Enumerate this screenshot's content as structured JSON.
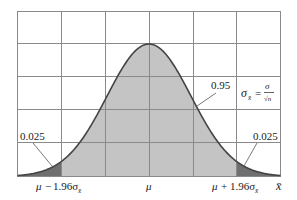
{
  "chart_data": {
    "type": "area",
    "title": "",
    "xlabel": "x̄",
    "ylabel": "",
    "mean_label": "μ",
    "tick_labels": [
      "μ − 1.96σx̄",
      "μ",
      "μ + 1.96σx̄"
    ],
    "regions": [
      {
        "name": "lower tail",
        "area": 0.025,
        "label": "0.025"
      },
      {
        "name": "central",
        "area": 0.95,
        "label": "0.95"
      },
      {
        "name": "upper tail",
        "area": 0.025,
        "label": "0.025"
      }
    ],
    "annotation_formula": "σx̄ = σ/√n",
    "grid": true,
    "grid_columns": 6,
    "grid_rows": 5,
    "colors": {
      "tail_fill": "#6f6f6f",
      "central_fill": "#c4c4c4",
      "curve": "#444444",
      "grid": "#8a8a8a"
    }
  },
  "labels": {
    "tail_left": "0.025",
    "tail_right": "0.025",
    "central": "0.95",
    "tick_left_mu": "μ",
    "tick_left_op": "−",
    "tick_left_coef": "1.96σ",
    "tick_right_mu": "μ",
    "tick_right_op": "+",
    "tick_right_coef": "1.96σ",
    "tick_center": "μ",
    "sub_xbar": "x̄",
    "axis_x": "x̄",
    "formula_lhs": "σ",
    "formula_sub": "x̄",
    "formula_eq": "=",
    "formula_num": "σ",
    "formula_den": "√n"
  }
}
